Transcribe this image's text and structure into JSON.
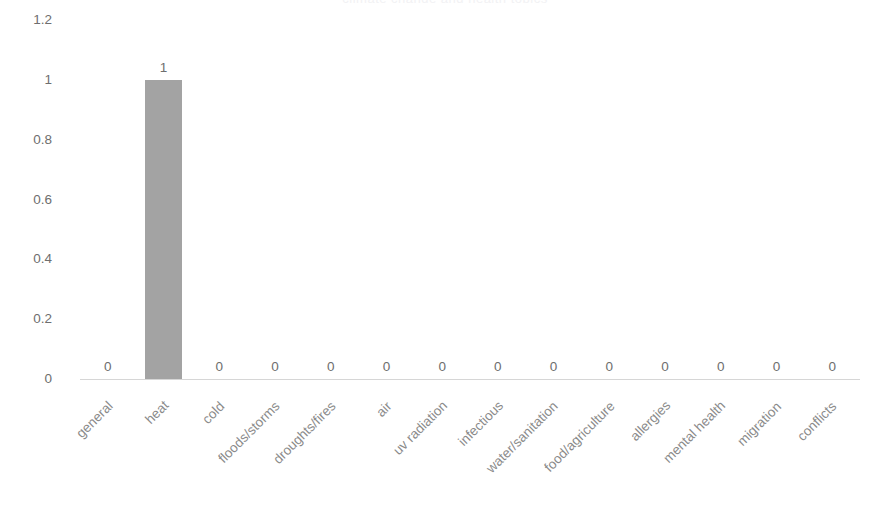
{
  "chart_data": {
    "type": "bar",
    "title": "",
    "xlabel": "",
    "ylabel": "",
    "ylim": [
      0,
      1.2
    ],
    "grid": false,
    "legend": null,
    "bar_color": "#a3a3a3",
    "text_color": "#6e6e6e",
    "category_label_color": "#8a8a8a",
    "axis_line_color": "#d6d6d6",
    "y_ticks": [
      "0",
      "0.2",
      "0.4",
      "0.6",
      "0.8",
      "1",
      "1.2"
    ],
    "y_tick_values": [
      0,
      0.2,
      0.4,
      0.6,
      0.8,
      1,
      1.2
    ],
    "categories": [
      "general",
      "heat",
      "cold",
      "floods/storms",
      "droughts/fires",
      "air",
      "uv radiation",
      "infectious",
      "water/sanitation",
      "food/agriculture",
      "allergies",
      "mental health",
      "migration",
      "conflicts"
    ],
    "values": [
      0,
      1,
      0,
      0,
      0,
      0,
      0,
      0,
      0,
      0,
      0,
      0,
      0,
      0
    ],
    "data_labels": [
      "0",
      "1",
      "0",
      "0",
      "0",
      "0",
      "0",
      "0",
      "0",
      "0",
      "0",
      "0",
      "0",
      "0"
    ]
  },
  "title_sliver": "climate change and health topics"
}
